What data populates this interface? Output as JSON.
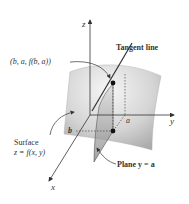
{
  "figure": {
    "axes": {
      "x_label": "x",
      "y_label": "y",
      "z_label": "z"
    },
    "tick_labels": {
      "a": "a",
      "b": "b"
    },
    "labels": {
      "point": "(b, a, f(b, a))",
      "tangent_line": "Tangent line",
      "surface_line1": "Surface",
      "surface_line2": "z = f(x, y)",
      "plane": "Plane y = a"
    },
    "colors": {
      "surface_light": "#eeeeee",
      "surface_dark": "#9a9a9a",
      "line": "#333333",
      "point": "#111111"
    }
  }
}
